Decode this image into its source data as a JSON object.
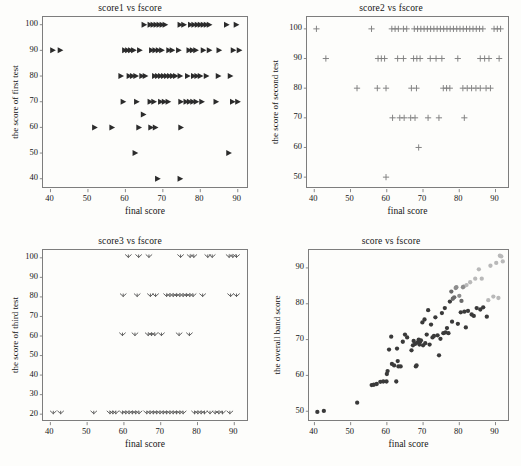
{
  "figure": {
    "background_color": "#fdfdfb",
    "axis_color": "#7d7d7d",
    "text_color": "#151515",
    "width": 521,
    "height": 466
  },
  "chart_data": [
    {
      "id": "panel1",
      "type": "scatter",
      "title": "score1 vs fscore",
      "xlabel": "final score",
      "ylabel": "the score of first test",
      "marker": "triangle-right",
      "marker_color": "#2b2b2b",
      "grid": false,
      "legend": "none",
      "xlim": [
        38,
        93
      ],
      "ylim": [
        36,
        103
      ],
      "xticks": [
        40,
        50,
        60,
        70,
        80,
        90
      ],
      "yticks": [
        40,
        50,
        60,
        70,
        80,
        90,
        100
      ],
      "points": [
        [
          65.0,
          100
        ],
        [
          66.6,
          100
        ],
        [
          67.4,
          100
        ],
        [
          68.2,
          100
        ],
        [
          69.0,
          100
        ],
        [
          69.8,
          100
        ],
        [
          70.6,
          100
        ],
        [
          74.6,
          100
        ],
        [
          75.6,
          100
        ],
        [
          77.4,
          100
        ],
        [
          78.3,
          100
        ],
        [
          79.2,
          100
        ],
        [
          80.0,
          100
        ],
        [
          80.8,
          100
        ],
        [
          81.6,
          100
        ],
        [
          82.4,
          100
        ],
        [
          87.0,
          100
        ],
        [
          89.6,
          100
        ],
        [
          40.6,
          90
        ],
        [
          42.6,
          90
        ],
        [
          59.8,
          90
        ],
        [
          60.6,
          90
        ],
        [
          61.4,
          90
        ],
        [
          62.2,
          90
        ],
        [
          63.8,
          90
        ],
        [
          67.0,
          90
        ],
        [
          67.9,
          90
        ],
        [
          68.8,
          90
        ],
        [
          69.7,
          90
        ],
        [
          71.6,
          90
        ],
        [
          72.5,
          90
        ],
        [
          74.2,
          90
        ],
        [
          77.0,
          90
        ],
        [
          77.9,
          90
        ],
        [
          78.8,
          90
        ],
        [
          80.8,
          90
        ],
        [
          82.4,
          90
        ],
        [
          85.0,
          90
        ],
        [
          88.8,
          90
        ],
        [
          90.4,
          90
        ],
        [
          58.8,
          80
        ],
        [
          61.0,
          80
        ],
        [
          61.9,
          80
        ],
        [
          62.8,
          80
        ],
        [
          64.4,
          80
        ],
        [
          65.3,
          80
        ],
        [
          67.8,
          80
        ],
        [
          68.6,
          80
        ],
        [
          69.4,
          80
        ],
        [
          70.2,
          80
        ],
        [
          71.0,
          80
        ],
        [
          71.8,
          80
        ],
        [
          72.6,
          80
        ],
        [
          73.4,
          80
        ],
        [
          74.6,
          80
        ],
        [
          76.6,
          80
        ],
        [
          78.2,
          80
        ],
        [
          79.1,
          80
        ],
        [
          80.0,
          80
        ],
        [
          81.6,
          80
        ],
        [
          84.8,
          80
        ],
        [
          88.0,
          80
        ],
        [
          59.4,
          70
        ],
        [
          63.0,
          70
        ],
        [
          66.6,
          70
        ],
        [
          67.6,
          70
        ],
        [
          69.4,
          70
        ],
        [
          70.4,
          70
        ],
        [
          71.4,
          70
        ],
        [
          74.8,
          70
        ],
        [
          76.2,
          70
        ],
        [
          77.1,
          70
        ],
        [
          78.0,
          70
        ],
        [
          78.9,
          70
        ],
        [
          80.4,
          70
        ],
        [
          84.2,
          70
        ],
        [
          88.6,
          70
        ],
        [
          90.0,
          70
        ],
        [
          64.8,
          65
        ],
        [
          51.8,
          60
        ],
        [
          56.4,
          60
        ],
        [
          63.6,
          60
        ],
        [
          66.8,
          60
        ],
        [
          68.0,
          60
        ],
        [
          74.8,
          60
        ],
        [
          62.6,
          50
        ],
        [
          87.6,
          50
        ],
        [
          68.6,
          40
        ],
        [
          74.6,
          40
        ]
      ]
    },
    {
      "id": "panel2",
      "type": "scatter",
      "title": "score2 vs fscore",
      "xlabel": "final score",
      "ylabel": "the score of second test",
      "marker": "plus",
      "marker_color": "#7e7e7e",
      "grid": false,
      "legend": "none",
      "xlim": [
        38,
        94
      ],
      "ylim": [
        46,
        104
      ],
      "xticks": [
        40,
        50,
        60,
        70,
        80,
        90
      ],
      "yticks": [
        50,
        60,
        70,
        80,
        90,
        100
      ],
      "points": [
        [
          40.6,
          100
        ],
        [
          55.8,
          100
        ],
        [
          61.4,
          100
        ],
        [
          62.3,
          100
        ],
        [
          63.2,
          100
        ],
        [
          64.6,
          100
        ],
        [
          65.5,
          100
        ],
        [
          67.6,
          100
        ],
        [
          68.5,
          100
        ],
        [
          69.4,
          100
        ],
        [
          70.3,
          100
        ],
        [
          71.2,
          100
        ],
        [
          72.1,
          100
        ],
        [
          73.0,
          100
        ],
        [
          73.9,
          100
        ],
        [
          74.8,
          100
        ],
        [
          75.7,
          100
        ],
        [
          76.6,
          100
        ],
        [
          77.5,
          100
        ],
        [
          78.4,
          100
        ],
        [
          79.3,
          100
        ],
        [
          80.2,
          100
        ],
        [
          81.1,
          100
        ],
        [
          82.0,
          100
        ],
        [
          82.9,
          100
        ],
        [
          83.8,
          100
        ],
        [
          84.7,
          100
        ],
        [
          85.6,
          100
        ],
        [
          86.5,
          100
        ],
        [
          89.6,
          100
        ],
        [
          90.5,
          100
        ],
        [
          91.4,
          100
        ],
        [
          43.2,
          90
        ],
        [
          57.6,
          90
        ],
        [
          58.5,
          90
        ],
        [
          59.4,
          90
        ],
        [
          63.0,
          90
        ],
        [
          64.6,
          90
        ],
        [
          67.4,
          90
        ],
        [
          68.3,
          90
        ],
        [
          69.2,
          90
        ],
        [
          72.0,
          90
        ],
        [
          73.6,
          90
        ],
        [
          75.2,
          90
        ],
        [
          79.6,
          90
        ],
        [
          85.8,
          90
        ],
        [
          87.0,
          90
        ],
        [
          88.2,
          90
        ],
        [
          91.0,
          90
        ],
        [
          51.8,
          80
        ],
        [
          57.4,
          80
        ],
        [
          59.8,
          80
        ],
        [
          66.8,
          80
        ],
        [
          68.2,
          80
        ],
        [
          75.6,
          80
        ],
        [
          76.5,
          80
        ],
        [
          77.4,
          80
        ],
        [
          81.0,
          80
        ],
        [
          82.2,
          80
        ],
        [
          83.4,
          80
        ],
        [
          84.6,
          80
        ],
        [
          85.8,
          80
        ],
        [
          87.4,
          80
        ],
        [
          88.6,
          80
        ],
        [
          61.6,
          70
        ],
        [
          63.6,
          70
        ],
        [
          64.8,
          70
        ],
        [
          66.6,
          70
        ],
        [
          67.8,
          70
        ],
        [
          71.4,
          70
        ],
        [
          74.4,
          70
        ],
        [
          81.4,
          70
        ],
        [
          68.8,
          60
        ],
        [
          59.8,
          50
        ]
      ]
    },
    {
      "id": "panel3",
      "type": "scatter",
      "title": "score3 vs fscore",
      "xlabel": "final score",
      "ylabel": "the score of third test",
      "marker": "tri-down",
      "marker_color": "#5a5a5a",
      "grid": false,
      "legend": "none",
      "xlim": [
        38,
        94
      ],
      "ylim": [
        16,
        104
      ],
      "xticks": [
        40,
        50,
        60,
        70,
        80,
        90
      ],
      "yticks": [
        20,
        30,
        40,
        50,
        60,
        70,
        80,
        90,
        100
      ],
      "points": [
        [
          61.2,
          100
        ],
        [
          64.0,
          100
        ],
        [
          66.8,
          100
        ],
        [
          75.4,
          100
        ],
        [
          78.0,
          100
        ],
        [
          79.0,
          100
        ],
        [
          82.8,
          100
        ],
        [
          84.0,
          100
        ],
        [
          88.6,
          100
        ],
        [
          89.6,
          100
        ],
        [
          90.6,
          100
        ],
        [
          59.8,
          80
        ],
        [
          63.6,
          80
        ],
        [
          67.2,
          80
        ],
        [
          68.6,
          80
        ],
        [
          71.6,
          80
        ],
        [
          72.5,
          80
        ],
        [
          73.4,
          80
        ],
        [
          74.3,
          80
        ],
        [
          75.2,
          80
        ],
        [
          76.1,
          80
        ],
        [
          77.0,
          80
        ],
        [
          77.9,
          80
        ],
        [
          78.8,
          80
        ],
        [
          81.4,
          80
        ],
        [
          89.0,
          80
        ],
        [
          90.6,
          80
        ],
        [
          59.6,
          60
        ],
        [
          63.0,
          60
        ],
        [
          66.6,
          60
        ],
        [
          67.5,
          60
        ],
        [
          68.4,
          60
        ],
        [
          70.2,
          60
        ],
        [
          75.0,
          60
        ],
        [
          77.8,
          60
        ],
        [
          40.8,
          20
        ],
        [
          42.8,
          20
        ],
        [
          51.8,
          20
        ],
        [
          56.2,
          20
        ],
        [
          57.0,
          20
        ],
        [
          57.8,
          20
        ],
        [
          59.6,
          20
        ],
        [
          60.5,
          20
        ],
        [
          61.4,
          20
        ],
        [
          62.3,
          20
        ],
        [
          63.2,
          20
        ],
        [
          64.1,
          20
        ],
        [
          66.2,
          20
        ],
        [
          67.1,
          20
        ],
        [
          68.0,
          20
        ],
        [
          68.9,
          20
        ],
        [
          69.8,
          20
        ],
        [
          70.7,
          20
        ],
        [
          71.6,
          20
        ],
        [
          72.5,
          20
        ],
        [
          73.4,
          20
        ],
        [
          74.3,
          20
        ],
        [
          75.2,
          20
        ],
        [
          76.1,
          20
        ],
        [
          79.2,
          20
        ],
        [
          80.1,
          20
        ],
        [
          81.0,
          20
        ],
        [
          81.9,
          20
        ],
        [
          83.4,
          20
        ],
        [
          84.8,
          20
        ],
        [
          85.8,
          20
        ],
        [
          86.8,
          20
        ],
        [
          88.8,
          20
        ]
      ]
    },
    {
      "id": "panel4",
      "type": "scatter",
      "title": "score vs fscore",
      "xlabel": "final score",
      "ylabel": "the overall band score",
      "marker": "circle",
      "marker_color": "#3a3a3a",
      "marker_color_light": "#b9b9b9",
      "grid": false,
      "legend": "none",
      "xlim": [
        38.5,
        94
      ],
      "ylim": [
        47,
        95
      ],
      "xticks": [
        40,
        50,
        60,
        70,
        80,
        90
      ],
      "yticks": [
        50,
        60,
        70,
        80,
        90
      ],
      "points": [
        [
          40.8,
          49.8
        ],
        [
          42.6,
          50.1
        ],
        [
          51.8,
          52.4
        ],
        [
          55.8,
          57.3
        ],
        [
          56.4,
          57.4
        ],
        [
          57.2,
          57.6
        ],
        [
          58.2,
          58.2
        ],
        [
          59.0,
          58.3
        ],
        [
          59.9,
          58.3
        ],
        [
          60.0,
          60.4
        ],
        [
          60.2,
          61.2
        ],
        [
          60.6,
          67.2
        ],
        [
          61.2,
          70.8
        ],
        [
          61.4,
          63.2
        ],
        [
          62.0,
          62.8
        ],
        [
          62.6,
          58.3
        ],
        [
          62.8,
          67.5
        ],
        [
          63.0,
          64.0
        ],
        [
          63.2,
          62.5
        ],
        [
          63.8,
          62.5
        ],
        [
          64.4,
          69.4
        ],
        [
          65.0,
          71.4
        ],
        [
          65.6,
          70.6
        ],
        [
          66.8,
          67.0
        ],
        [
          67.2,
          68.4
        ],
        [
          67.4,
          69.6
        ],
        [
          67.8,
          68.8
        ],
        [
          68.0,
          62.5
        ],
        [
          68.2,
          62.8
        ],
        [
          68.4,
          69.2
        ],
        [
          68.8,
          70.0
        ],
        [
          69.0,
          68.6
        ],
        [
          69.2,
          69.4
        ],
        [
          69.4,
          69.8
        ],
        [
          69.8,
          74.8
        ],
        [
          70.0,
          68.4
        ],
        [
          70.4,
          75.6
        ],
        [
          70.6,
          69.0
        ],
        [
          71.0,
          71.4
        ],
        [
          71.4,
          78.2
        ],
        [
          71.8,
          68.6
        ],
        [
          72.2,
          74.2
        ],
        [
          72.6,
          70.6
        ],
        [
          73.0,
          71.0
        ],
        [
          73.4,
          76.2
        ],
        [
          74.0,
          71.2
        ],
        [
          74.4,
          65.6
        ],
        [
          74.8,
          70.2
        ],
        [
          75.2,
          77.4
        ],
        [
          75.6,
          71.8
        ],
        [
          76.0,
          78.8
        ],
        [
          76.2,
          72.0
        ],
        [
          76.6,
          73.2
        ],
        [
          77.0,
          71.8
        ],
        [
          77.4,
          80.6
        ],
        [
          77.8,
          83.4
        ],
        [
          78.0,
          75.0
        ],
        [
          78.2,
          81.4
        ],
        [
          78.6,
          81.8
        ],
        [
          79.0,
          84.4
        ],
        [
          79.2,
          84.6
        ],
        [
          79.6,
          74.4
        ],
        [
          80.0,
          82.2
        ],
        [
          80.4,
          77.6
        ],
        [
          80.6,
          80.8
        ],
        [
          81.0,
          84.6
        ],
        [
          81.2,
          84.8
        ],
        [
          81.4,
          77.8
        ],
        [
          81.8,
          73.4
        ],
        [
          82.0,
          85.2
        ],
        [
          82.4,
          78.0
        ],
        [
          83.0,
          86.0
        ],
        [
          83.4,
          77.0
        ],
        [
          84.0,
          76.6
        ],
        [
          84.4,
          87.0
        ],
        [
          84.8,
          78.8
        ],
        [
          85.4,
          89.6
        ],
        [
          85.8,
          78.4
        ],
        [
          86.2,
          87.0
        ],
        [
          86.6,
          79.0
        ],
        [
          87.6,
          76.4
        ],
        [
          88.0,
          81.0
        ],
        [
          88.6,
          90.6
        ],
        [
          89.4,
          82.0
        ],
        [
          90.2,
          91.4
        ],
        [
          90.8,
          81.6
        ],
        [
          91.2,
          93.4
        ],
        [
          91.6,
          93.2
        ],
        [
          92.0,
          91.8
        ]
      ],
      "light_threshold_x": 77.5,
      "light_threshold_y": 80.0
    }
  ]
}
